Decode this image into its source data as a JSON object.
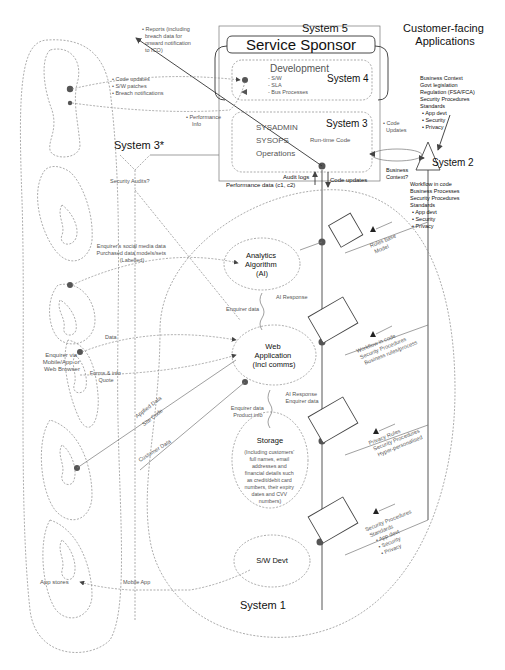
{
  "header": {
    "customer_facing": [
      "Customer-facing",
      "Applications"
    ]
  },
  "system5": {
    "label": "System 5",
    "title": "Service Sponsor"
  },
  "system4": {
    "label": "System 4",
    "title": "Development",
    "items": [
      "- S/W",
      "- SLA",
      "- Bus Processes"
    ]
  },
  "system3": {
    "label": "System 3",
    "items": [
      "SYSADMIN",
      "SYSOPS",
      "Operations"
    ],
    "runtime": "Run-time Code"
  },
  "system3star": {
    "label": "System 3*",
    "note": "Security Audits?"
  },
  "system2": {
    "label": "System 2",
    "top_notes": [
      "Business Context",
      "Govt legislation",
      "Regulation (FSA/FCA)",
      "Security Procedures",
      "Standards",
      "• App devt",
      "• Security",
      "• Privacy"
    ],
    "bottom_notes": [
      "Workflow in code",
      "Business Processes",
      "Security Procedures",
      "Standards",
      "• App devt",
      "• Security",
      "• Privacy"
    ],
    "business_context": [
      "Business",
      "Context?"
    ],
    "code_updates": [
      "• Code",
      "Updates"
    ]
  },
  "system1": {
    "label": "System 1"
  },
  "flows": {
    "reports": [
      "• Reports (including",
      "breach data for",
      "onward notification",
      "to ICO)"
    ],
    "code_updates_list": [
      "• Code updates",
      "• S/W patches",
      "• Breach notifications"
    ],
    "performance_info": [
      "• Performance",
      "Info"
    ],
    "audit_logs": "Audit logs",
    "performance_data": "Performance data (c1, c2)",
    "code_updates": "Code updates",
    "social_media": [
      "Enquirer's social media data",
      "Purchased data models/sets",
      "(Labelled)"
    ],
    "data": "Data",
    "enquirer_label": [
      "Enquirer via",
      "Mobile/App or",
      "Web Browser"
    ],
    "forms_quote": [
      "Forms & info",
      "Quote"
    ],
    "applied_data": [
      "Applied Data",
      "Site Code"
    ],
    "customer_data": "Customer Data",
    "app_stores": "App stores",
    "mobile_app": "Mobile App",
    "enquirer_data_ai": "Enquirer data",
    "ai_response": "AI Response",
    "storage_left": [
      "Enquirer data",
      "Product info"
    ],
    "storage_right": [
      "AI Response",
      "Enquirer data"
    ]
  },
  "nodes": {
    "analytics": [
      "Analytics",
      "Algorithm",
      "(AI)"
    ],
    "webapp": [
      "Web",
      "Application",
      "(Incl comms)"
    ],
    "storage_title": "Storage",
    "storage_desc": [
      "(Including customers'",
      "full names, email",
      "addresses and",
      "financial details such",
      "as credit/debit card",
      "numbers, their expiry",
      "dates and CVV",
      "numbers)"
    ],
    "swdevt": "S/W Devt"
  },
  "regulators": {
    "r1": [
      "Rules base",
      "Model"
    ],
    "r2": [
      "Workflow in code",
      "Security Procedures",
      "Business rules/process"
    ],
    "r3": [
      "Privacy Rules",
      "Security Procedures",
      "Hyper-personalised"
    ],
    "r4": [
      "Security Procedures",
      "Standards",
      "• App devt",
      "• Security",
      "• Privacy"
    ]
  }
}
